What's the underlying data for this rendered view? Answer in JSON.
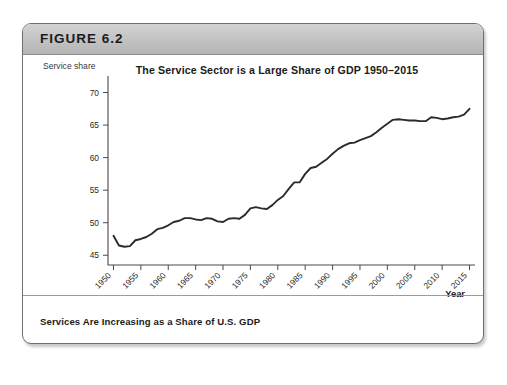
{
  "figure": {
    "label": "FIGURE 6.2",
    "caption": "Services Are Increasing as a Share of U.S. GDP"
  },
  "chart_data": {
    "type": "line",
    "title": "The Service Sector is a Large Share of GDP 1950–2015",
    "xlabel": "Year",
    "ylabel": "Service share",
    "xlim": [
      1949,
      2016
    ],
    "ylim": [
      43.5,
      71
    ],
    "grid": false,
    "legend": "none",
    "xticks": [
      1950,
      1955,
      1960,
      1965,
      1970,
      1975,
      1980,
      1985,
      1990,
      1995,
      2000,
      2005,
      2010,
      2015
    ],
    "xtick_labels": [
      "1950",
      "1955",
      "1960",
      "1965",
      "1970",
      "1975",
      "1980",
      "1985",
      "1990",
      "1995",
      "2000",
      "2005",
      "2010",
      "2015"
    ],
    "xtick_rotation": 45,
    "yticks": [
      45,
      50,
      55,
      60,
      65,
      70
    ],
    "ytick_labels": [
      "45",
      "50",
      "55",
      "60",
      "65",
      "70"
    ],
    "series": [
      {
        "name": "Service share of GDP",
        "color": "#2b2b2b",
        "x": [
          1950,
          1951,
          1952,
          1953,
          1954,
          1955,
          1956,
          1957,
          1958,
          1959,
          1960,
          1961,
          1962,
          1963,
          1964,
          1965,
          1966,
          1967,
          1968,
          1969,
          1970,
          1971,
          1972,
          1973,
          1974,
          1975,
          1976,
          1977,
          1978,
          1979,
          1980,
          1981,
          1982,
          1983,
          1984,
          1985,
          1986,
          1987,
          1988,
          1989,
          1990,
          1991,
          1992,
          1993,
          1994,
          1995,
          1996,
          1997,
          1998,
          1999,
          2000,
          2001,
          2002,
          2003,
          2004,
          2005,
          2006,
          2007,
          2008,
          2009,
          2010,
          2011,
          2012,
          2013,
          2014,
          2015
        ],
        "values": [
          48.0,
          46.5,
          46.3,
          46.4,
          47.3,
          47.5,
          47.8,
          48.3,
          49.0,
          49.2,
          49.6,
          50.1,
          50.3,
          50.7,
          50.7,
          50.5,
          50.4,
          50.7,
          50.6,
          50.2,
          50.1,
          50.6,
          50.7,
          50.6,
          51.2,
          52.2,
          52.4,
          52.2,
          52.1,
          52.7,
          53.5,
          54.1,
          55.2,
          56.2,
          56.2,
          57.5,
          58.4,
          58.6,
          59.2,
          59.8,
          60.6,
          61.3,
          61.8,
          62.2,
          62.3,
          62.7,
          63.0,
          63.3,
          63.9,
          64.6,
          65.2,
          65.8,
          65.9,
          65.8,
          65.7,
          65.7,
          65.6,
          65.6,
          66.2,
          66.1,
          65.9,
          66.0,
          66.2,
          66.3,
          66.6,
          67.5
        ]
      }
    ]
  }
}
